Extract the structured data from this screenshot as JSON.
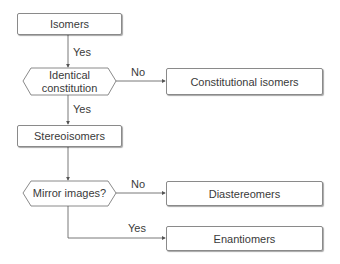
{
  "nodes": {
    "isomers": "Isomers",
    "identical_constitution": "Identical constitution",
    "constitutional_isomers": "Constitutional isomers",
    "stereoisomers": "Stereoisomers",
    "mirror_images": "Mirror images?",
    "diastereomers": "Diastereomers",
    "enantiomers": "Enantiomers"
  },
  "edges": {
    "isomers_to_identical": "Yes",
    "identical_to_constitutional": "No",
    "identical_to_stereoisomers": "Yes",
    "mirror_to_diastereomers": "No",
    "mirror_to_enantiomers": "Yes"
  }
}
